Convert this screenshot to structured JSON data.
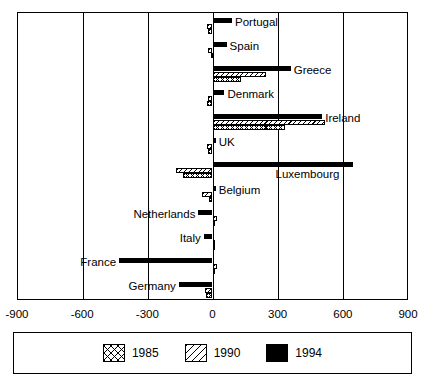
{
  "chart_data": {
    "type": "bar",
    "orientation": "horizontal",
    "title": "",
    "subtitle": "",
    "xlabel": "",
    "ylabel": "",
    "xlim": [
      -900,
      900
    ],
    "xticks": [
      -900,
      -600,
      -300,
      0,
      300,
      600,
      900
    ],
    "xtick_labels": [
      "-900",
      "-600",
      "-300",
      "0",
      "300",
      "600",
      "900"
    ],
    "grid": true,
    "grid_axis": "x",
    "legend_position": "bottom",
    "categories": [
      "Portugal",
      "Spain",
      "Greece",
      "Denmark",
      "Ireland",
      "UK",
      "Luxembourg",
      "Belgium",
      "Netherlands",
      "Italy",
      "France",
      "Germany"
    ],
    "series": [
      {
        "name": "1985",
        "pattern": "cross-hatch",
        "color": "#ffffff",
        "edge_color": "#000000",
        "values": [
          -20,
          -5,
          130,
          -25,
          335,
          -20,
          -135,
          -15,
          10,
          10,
          5,
          -30
        ]
      },
      {
        "name": "1990",
        "pattern": "diagonal-hatch",
        "color": "#ffffff",
        "edge_color": "#000000",
        "values": [
          -25,
          -20,
          245,
          -20,
          520,
          -25,
          -170,
          -50,
          20,
          10,
          20,
          -35
        ]
      },
      {
        "name": "1994",
        "pattern": "solid",
        "color": "#000000",
        "edge_color": "#000000",
        "values": [
          90,
          65,
          360,
          55,
          505,
          15,
          645,
          15,
          -65,
          -40,
          -430,
          -155
        ]
      }
    ]
  },
  "legend": {
    "entries": [
      {
        "label": "1985",
        "swatch": "cross-hatch-swatch"
      },
      {
        "label": "1990",
        "swatch": "diagonal-hatch-swatch"
      },
      {
        "label": "1994",
        "swatch": "solid-black-swatch"
      }
    ]
  }
}
